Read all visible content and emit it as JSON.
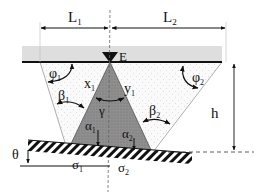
{
  "diagram": {
    "labels": {
      "L1": "L",
      "L1_sub": "1",
      "L2": "L",
      "L2_sub": "2",
      "E": "E",
      "phi1": "φ",
      "phi1_sub": "1",
      "phi2": "φ",
      "phi2_sub": "2",
      "beta1": "β",
      "beta1_sub": "1",
      "beta2": "β",
      "beta2_sub": "2",
      "x1": "x",
      "x1_sub": "1",
      "y1": "y",
      "y1_sub": "1",
      "gamma": "γ",
      "alpha1": "α",
      "alpha1_sub": "1",
      "alpha2": "α",
      "alpha2_sub": "2",
      "theta": "θ",
      "h": "h",
      "sigma1": "σ",
      "sigma1_sub": "1",
      "sigma2": "σ",
      "sigma2_sub": "2"
    },
    "colors": {
      "ink": "#111111",
      "cone_fill": "#8c8c8c",
      "surface_band": "#d9d9d9",
      "dotted_region": "#f4f4f4",
      "guide_line": "#9a9a9a"
    }
  }
}
